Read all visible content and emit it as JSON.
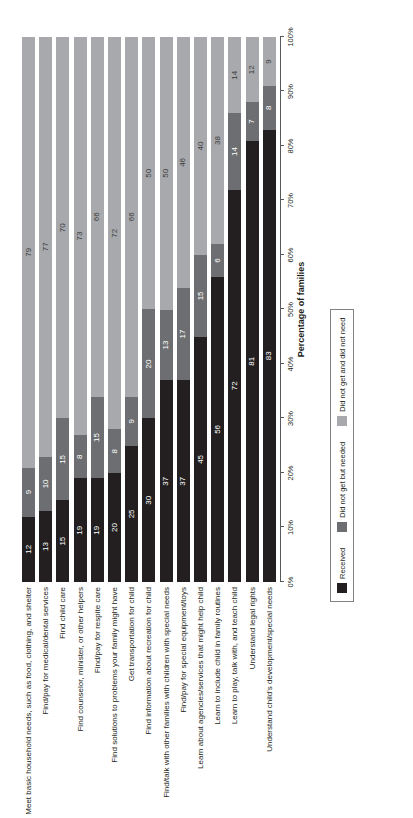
{
  "chart_data": {
    "type": "bar",
    "orientation": "horizontal",
    "stacked": true,
    "stack_total": 100,
    "title": "",
    "subtitle": "",
    "xlabel": "Percentage of families",
    "ylabel": "",
    "xlim": [
      0,
      100
    ],
    "grid": false,
    "legend_position": "bottom-left",
    "tick_labels": [
      "0%",
      "10%",
      "20%",
      "30%",
      "40%",
      "50%",
      "60%",
      "70%",
      "80%",
      "90%",
      "100%"
    ],
    "tick_values": [
      0,
      10,
      20,
      30,
      40,
      50,
      60,
      70,
      80,
      90,
      100
    ],
    "series": [
      {
        "name": "Received",
        "color": "#231f20",
        "values": [
          12,
          13,
          15,
          19,
          19,
          20,
          25,
          30,
          37,
          37,
          45,
          56,
          72,
          81,
          83
        ]
      },
      {
        "name": "Did not get but needed",
        "color": "#6d6e71",
        "values": [
          9,
          10,
          15,
          8,
          15,
          8,
          9,
          20,
          13,
          17,
          15,
          6,
          14,
          7,
          8
        ]
      },
      {
        "name": "Did not get and did not need",
        "color": "#a7a9ac",
        "values": [
          79,
          77,
          70,
          73,
          66,
          72,
          66,
          50,
          50,
          46,
          40,
          38,
          14,
          12,
          9
        ]
      }
    ],
    "categories": [
      "Meet basic household needs, such as food, clothing, and shelter",
      "Find/pay for medical/dental services",
      "Find child care",
      "Find counselor, minister, or other helpers",
      "Find/pay for respite care",
      "Find solutions to problems your family might have",
      "Get transportation for child",
      "Find information about recreation for child",
      "Find/talk with other families with children with special needs",
      "Find/pay for special equipment/toys",
      "Learn about agencies/services that might help child",
      "Learn to include child in family routines",
      "Learn to play, talk with, and teach child",
      "Understand legal rights",
      "Understand child's development/special needs"
    ]
  }
}
